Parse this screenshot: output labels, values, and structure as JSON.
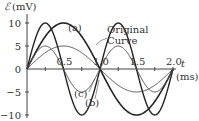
{
  "chart_data": {
    "type": "line",
    "title": "",
    "xlabel": "t",
    "xunit": "(ms)",
    "ylabel": "ℰ",
    "yunit": "(mV)",
    "xlim": [
      0,
      2.0
    ],
    "ylim": [
      -10,
      10
    ],
    "grid": false,
    "x_ticks": [
      0.25,
      0.5,
      0.75,
      1.0,
      1.25,
      1.5,
      1.75,
      2.0
    ],
    "x_tick_labels": [
      {
        "value": 0.5,
        "label": "0.5"
      },
      {
        "value": 1.0,
        "label": "1.0"
      },
      {
        "value": 1.5,
        "label": "1.5"
      },
      {
        "value": 2.0,
        "label": "2.0"
      }
    ],
    "y_tick_labels": [
      {
        "value": 10,
        "label": "10"
      },
      {
        "value": 5,
        "label": "5"
      },
      {
        "value": 0,
        "label": "0"
      },
      {
        "value": -5,
        "label": "−5"
      },
      {
        "value": -10,
        "label": "−10"
      }
    ],
    "series": [
      {
        "name": "Original Curve",
        "amplitude_mV": 5,
        "period_ms": 2.0,
        "stroke_width": 1,
        "color": "#555555"
      },
      {
        "name": "(a)",
        "amplitude_mV": 10,
        "period_ms": 2.0,
        "stroke_width": 1.6,
        "color": "#222222"
      },
      {
        "name": "(b)",
        "amplitude_mV": 10,
        "period_ms": 1.0,
        "stroke_width": 1.4,
        "color": "#222222"
      },
      {
        "name": "(c)",
        "amplitude_mV": 5,
        "period_ms": 1.0,
        "stroke_width": 1,
        "color": "#555555"
      }
    ],
    "annotations": [
      {
        "text": "(a)",
        "x_px": 64,
        "y_px": 32
      },
      {
        "text": "Original",
        "x_px": 107,
        "y_px": 34
      },
      {
        "text": "Curve",
        "x_px": 107,
        "y_px": 45
      },
      {
        "text": "(c)",
        "x_px": 73,
        "y_px": 98
      },
      {
        "text": "(b)",
        "x_px": 85,
        "y_px": 106
      }
    ]
  },
  "labels": {
    "y_axis_symbol": "ℰ",
    "y_axis_unit": "(mV)",
    "x_axis_symbol": "t",
    "x_axis_unit": "(ms)",
    "ann_a": "(a)",
    "ann_original_1": "Original",
    "ann_original_2": "Curve",
    "ann_c": "(c)",
    "ann_b": "(b)"
  }
}
